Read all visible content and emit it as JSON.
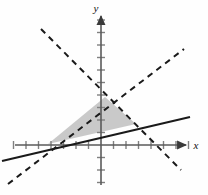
{
  "figure": {
    "background_color": "#fefefe"
  },
  "axes": {
    "x_label": "x",
    "y_label": "y",
    "origin_px": [
      101,
      145
    ],
    "unit_px": 12.5,
    "x_axis": {
      "x1": 15,
      "y1": 145,
      "x2": 188,
      "y2": 145,
      "color": "#555555",
      "arrow": "right"
    },
    "y_axis": {
      "x1": 101,
      "y1": 185,
      "x2": 101,
      "y2": 14,
      "color": "#555555",
      "arrow": "up"
    },
    "x_ticks": [
      -7,
      -6,
      -5,
      -4,
      -3,
      -2,
      -1,
      1,
      2,
      3,
      4,
      5,
      6,
      7
    ],
    "y_ticks": [
      -3,
      -2,
      -1,
      1,
      2,
      3,
      4,
      5,
      6,
      7,
      8,
      9,
      10
    ],
    "tick_half_len_px": 4,
    "tick_color": "#777777",
    "axis_label_color": "#111111"
  },
  "chart_data": {
    "type": "line",
    "title": "",
    "xlabel": "x",
    "ylabel": "y",
    "xlim": [
      -7.5,
      7.5
    ],
    "ylim": [
      -3.5,
      10.5
    ],
    "grid": false,
    "legend": "none",
    "series": [
      {
        "name": "solid-line",
        "style": "solid",
        "color": "#1a1a1a",
        "width_px": 2,
        "points_px": [
          [
            2,
            161
          ],
          [
            190,
            117
          ]
        ],
        "slope_est": -0.234,
        "note": "shallow positive-slope solid line (screen y inverted)"
      },
      {
        "name": "dashed-line-ascending",
        "style": "dashed",
        "color": "#1a1a1a",
        "width_px": 2,
        "points_px": [
          [
            8,
            184
          ],
          [
            184,
            49
          ]
        ],
        "slope_est": -0.767,
        "note": "steeper positive-slope dashed boundary"
      },
      {
        "name": "dashed-line-descending",
        "style": "dashed",
        "color": "#1a1a1a",
        "width_px": 2,
        "points_px": [
          [
            41,
            29
          ],
          [
            181,
            170
          ]
        ],
        "slope_est": 1.007,
        "note": "negative-slope dashed boundary"
      }
    ],
    "shaded_region": {
      "name": "feasible-triangle",
      "fill": "#bfbfbf",
      "opacity": 0.85,
      "vertices_px": [
        [
          48,
          144
        ],
        [
          105,
          97
        ],
        [
          136,
          124
        ]
      ],
      "note": "gray triangular region bounded by the two dashed lines and the solid line"
    }
  }
}
